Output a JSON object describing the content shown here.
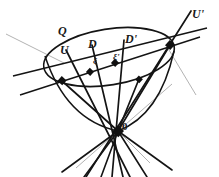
{
  "figure": {
    "type": "geometric-line-diagram",
    "background_color": "#ffffff",
    "ink_color": "#1a1a1a",
    "faint_ink_color": "#8c8c8c",
    "labels": {
      "quadric": "Q",
      "generator_u": "U",
      "generator_d": "D",
      "generator_d_prime": "D'",
      "generator_u_prime": "U'",
      "point_xi": "ξ",
      "point_xi_prime": "ξ'",
      "apex": "0"
    },
    "geometry": {
      "apex": [
        118,
        131
      ],
      "ellipse": {
        "center": [
          109,
          57
        ],
        "rx": 66,
        "ry": 28,
        "rotation_deg": -9
      },
      "nodes": [
        [
          62,
          81
        ],
        [
          90,
          72
        ],
        [
          115,
          63
        ],
        [
          170,
          45
        ],
        [
          139,
          79
        ]
      ],
      "chord_endpoints": [
        [
          22,
          94
        ],
        [
          198,
          38
        ]
      ],
      "secondary_chord_endpoints": [
        [
          14,
          75
        ],
        [
          206,
          28
        ]
      ],
      "generators": [
        {
          "name": "U",
          "top": [
            66,
            50
          ],
          "bottom": [
            128,
            176
          ]
        },
        {
          "name": "D",
          "top": [
            92,
            45
          ],
          "bottom": [
            122,
            176
          ]
        },
        {
          "name": "D'",
          "top": [
            124,
            40
          ],
          "bottom": [
            112,
            176
          ]
        },
        {
          "name": "U'",
          "top": [
            190,
            12
          ],
          "bottom": [
            88,
            176
          ]
        }
      ],
      "extra_rays": [
        [
          [
            48,
            33
          ],
          [
            174,
            176
          ]
        ],
        [
          [
            63,
            176
          ],
          [
            162,
            45
          ]
        ],
        [
          [
            96,
            176
          ],
          [
            156,
            82
          ]
        ]
      ]
    }
  }
}
